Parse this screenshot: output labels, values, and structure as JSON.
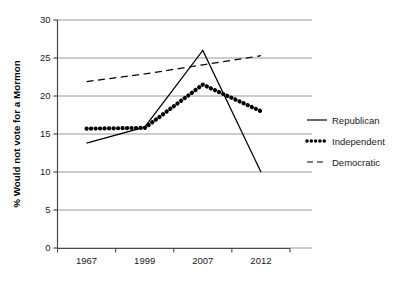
{
  "chart_data": {
    "type": "line",
    "title": "",
    "xlabel": "",
    "ylabel": "% Would not vote for a Mormon",
    "categories": [
      "1967",
      "1999",
      "2007",
      "2012"
    ],
    "ylim": [
      0,
      30
    ],
    "yticks": [
      0,
      5,
      10,
      15,
      20,
      25,
      30
    ],
    "ytick_labels": [
      "0",
      "5",
      "10",
      "15",
      "20",
      "25",
      "30"
    ],
    "grid": true,
    "legend_position": "right",
    "series": [
      {
        "name": "Republican",
        "style": "solid",
        "color": "#000000",
        "values": [
          13.8,
          15.9,
          26.0,
          10.0
        ]
      },
      {
        "name": "Independent",
        "style": "dotted",
        "color": "#000000",
        "values": [
          15.7,
          15.8,
          21.5,
          18.0
        ]
      },
      {
        "name": "Democratic",
        "style": "dashed",
        "color": "#000000",
        "values": [
          21.9,
          22.9,
          24.1,
          25.3
        ]
      }
    ]
  },
  "axis": {
    "y_title": "% Would not vote for a Mormon",
    "y_labels": [
      "30",
      "25",
      "20",
      "15",
      "10",
      "5",
      "0"
    ],
    "x_labels": [
      "1967",
      "1999",
      "2007",
      "2012"
    ]
  },
  "legend": {
    "items": [
      {
        "label": "Republican",
        "swatch": "solid-line-icon"
      },
      {
        "label": "Independent",
        "swatch": "dotted-line-icon"
      },
      {
        "label": "Democratic",
        "swatch": "dashed-line-icon"
      }
    ]
  }
}
